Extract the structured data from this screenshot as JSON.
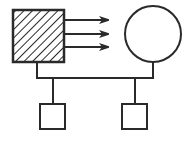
{
  "diagram": {
    "type": "pedigree",
    "colors": {
      "stroke": "#2a2a2a",
      "background": "#ffffff",
      "fill_unaffected": "#ffffff"
    },
    "nodes": [
      {
        "id": "father",
        "shape": "square",
        "fill": "hatched",
        "role": "parent-male-affected"
      },
      {
        "id": "mother",
        "shape": "circle",
        "fill": "empty",
        "role": "parent-female"
      },
      {
        "id": "child1",
        "shape": "square",
        "fill": "empty",
        "role": "child-male"
      },
      {
        "id": "child2",
        "shape": "square",
        "fill": "empty",
        "role": "child-male"
      }
    ],
    "annotations": [
      {
        "type": "arrows",
        "count": 3,
        "from": "father",
        "direction": "right"
      }
    ],
    "edges": [
      {
        "from": "father",
        "to": "mother",
        "type": "mating-line"
      },
      {
        "from": "mating-line",
        "to": "child1",
        "type": "descent"
      },
      {
        "from": "mating-line",
        "to": "child2",
        "type": "descent"
      }
    ]
  }
}
